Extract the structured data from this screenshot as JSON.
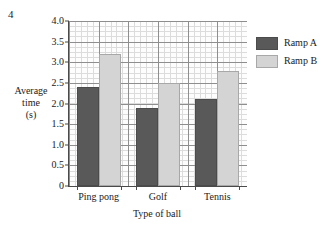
{
  "question_number": "4",
  "chart_data": {
    "type": "bar",
    "title": "",
    "xlabel": "Type of ball",
    "ylabel": "Average time (s)",
    "ylabel_lines": [
      "Average",
      "time",
      "(s)"
    ],
    "categories": [
      "Ping pong",
      "Golf",
      "Tennis"
    ],
    "series": [
      {
        "name": "Ramp A",
        "color": "#595959",
        "values": [
          2.4,
          1.9,
          2.1
        ]
      },
      {
        "name": "Ramp B",
        "color": "#d4d4d4",
        "values": [
          3.2,
          2.5,
          2.8
        ]
      }
    ],
    "ylim": [
      0,
      4.0
    ],
    "ytick_labels": [
      "0",
      "0.5",
      "1.0",
      "1.5",
      "2.0",
      "2.5",
      "3.0",
      "3.5",
      "4.0"
    ],
    "ytick_values": [
      0,
      0.5,
      1.0,
      1.5,
      2.0,
      2.5,
      3.0,
      3.5,
      4.0
    ],
    "grid": true,
    "minor_grid": true,
    "legend_position": "right"
  }
}
